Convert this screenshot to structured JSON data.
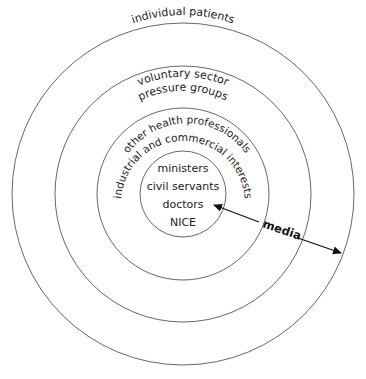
{
  "diagram": {
    "type": "concentric-circles",
    "rings": [
      {
        "id": "outer",
        "label": "individual patients"
      },
      {
        "id": "second",
        "lines": [
          "voluntary sector",
          "pressure groups"
        ]
      },
      {
        "id": "third",
        "lines": [
          "other health professionals",
          "industrial and commercial interests"
        ]
      },
      {
        "id": "core",
        "lines": [
          "ministers",
          "civil servants",
          "doctors",
          "NICE"
        ]
      }
    ],
    "arrow": {
      "label": "media",
      "direction": "bidirectional",
      "from": "core",
      "to": "outer"
    },
    "colors": {
      "stroke": "#555555",
      "text": "#222222",
      "background": "#ffffff"
    }
  }
}
